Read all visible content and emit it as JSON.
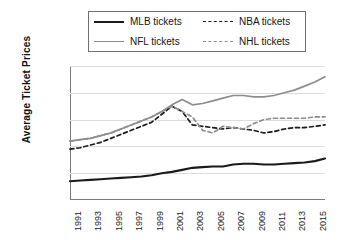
{
  "chart_data": {
    "type": "line",
    "title": "",
    "xlabel": "",
    "ylabel": "Average Ticket Prices",
    "ylim": [
      0,
      100
    ],
    "xlim": [
      1991,
      2016
    ],
    "grid": true,
    "legend_position": "top",
    "ytick_labels": [
      "$100",
      "$80",
      "$60",
      "$40",
      "$20",
      "$0"
    ],
    "ytick_values": [
      100,
      80,
      60,
      40,
      20,
      0
    ],
    "xtick_labels": [
      "1991",
      "1993",
      "1995",
      "1997",
      "1999",
      "2001",
      "2003",
      "2005",
      "2007",
      "2009",
      "2011",
      "2013",
      "2015"
    ],
    "x": [
      1991,
      1992,
      1993,
      1994,
      1995,
      1996,
      1997,
      1998,
      1999,
      2000,
      2001,
      2002,
      2003,
      2004,
      2005,
      2006,
      2007,
      2008,
      2009,
      2010,
      2011,
      2012,
      2013,
      2014,
      2015,
      2016
    ],
    "series": [
      {
        "name": "MLB tickets",
        "style": "solid",
        "color": "#1a1a1a",
        "values": [
          14,
          14.5,
          15,
          15.5,
          16,
          16.5,
          17,
          17.5,
          18.5,
          20,
          21,
          22.5,
          24,
          24.5,
          25,
          25,
          26.5,
          27,
          27,
          26.5,
          26.5,
          27,
          27.5,
          28,
          29,
          31
        ]
      },
      {
        "name": "NFL tickets",
        "style": "solid",
        "color": "#8d8d8d",
        "values": [
          44,
          45,
          46,
          48,
          50,
          53,
          56,
          59,
          62,
          66,
          71,
          75,
          71,
          72,
          74,
          76,
          78,
          78,
          77,
          77,
          78,
          80,
          82,
          85,
          88,
          92
        ]
      },
      {
        "name": "NBA tickets",
        "style": "dashed",
        "color": "#1a1a1a",
        "values": [
          38,
          39,
          41,
          43,
          46,
          49,
          52,
          55,
          58,
          64,
          70,
          66,
          56,
          55,
          54,
          53,
          54,
          53,
          52,
          50,
          51,
          53,
          54,
          54,
          55,
          56
        ]
      },
      {
        "name": "NHL tickets",
        "style": "dashed",
        "color": "#8d8d8d",
        "values": [
          44,
          45,
          46,
          48,
          50,
          53,
          56,
          59,
          62,
          66,
          70,
          66,
          62,
          52,
          50,
          55,
          54,
          53,
          57,
          60,
          61,
          61,
          61,
          61,
          62,
          62
        ]
      }
    ]
  },
  "legend": {
    "entries": [
      {
        "label": "MLB tickets"
      },
      {
        "label": "NBA tickets"
      },
      {
        "label": "NFL tickets"
      },
      {
        "label": "NHL tickets"
      }
    ]
  }
}
